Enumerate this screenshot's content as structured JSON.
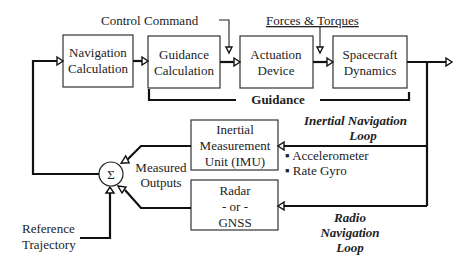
{
  "diagram": {
    "type": "block-diagram",
    "top_labels": {
      "control_command": "Control Command",
      "forces_torques": "Forces & Torques"
    },
    "blocks": {
      "navigation": [
        "Navigation",
        "Calculation"
      ],
      "guidance": [
        "Guidance",
        "Calculation"
      ],
      "actuation": [
        "Actuation",
        "Device"
      ],
      "dynamics": [
        "Spacecraft",
        "Dynamics"
      ],
      "imu": [
        "Inertial",
        "Measurement",
        "Unit (IMU)"
      ],
      "radar": [
        "Radar",
        "- or -",
        "GNSS"
      ]
    },
    "guidance_bracket_label": "Guidance",
    "sum_symbol": "Σ",
    "measured_outputs": [
      "Measured",
      "Outputs"
    ],
    "reference": [
      "Reference",
      "Trajectory"
    ],
    "imu_sensors": [
      "▪ Accelerometer",
      "▪ Rate Gyro"
    ],
    "inertial_loop": [
      "Inertial Navigation",
      "Loop"
    ],
    "radio_loop": [
      "Radio",
      "Navigation",
      "Loop"
    ],
    "colors": {
      "line": "#111111",
      "box_border": "#333333",
      "text": "#222222",
      "background": "#ffffff"
    }
  }
}
